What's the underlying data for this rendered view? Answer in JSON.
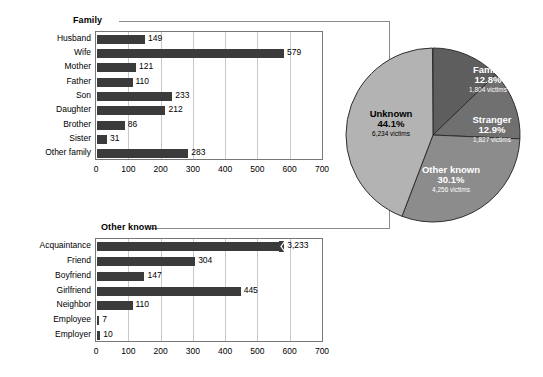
{
  "chart_data": [
    {
      "type": "bar",
      "orientation": "horizontal",
      "title": "Family",
      "categories": [
        "Husband",
        "Wife",
        "Mother",
        "Father",
        "Son",
        "Daughter",
        "Brother",
        "Sister",
        "Other family"
      ],
      "values": [
        149,
        579,
        121,
        110,
        233,
        212,
        86,
        31,
        283
      ],
      "value_labels": [
        "149",
        "579",
        "121",
        "110",
        "233",
        "212",
        "86",
        "31",
        "283"
      ],
      "xlabel": "",
      "ylabel": "",
      "xlim": [
        0,
        700
      ],
      "xticks": [
        0,
        100,
        200,
        300,
        400,
        500,
        600,
        700
      ],
      "xtick_labels": [
        "0",
        "100",
        "200",
        "300",
        "400",
        "500",
        "600",
        "700"
      ],
      "grid": true,
      "bar_color": "#3b3b3b",
      "legend": "none"
    },
    {
      "type": "bar",
      "orientation": "horizontal",
      "title": "Other known",
      "categories": [
        "Acquaintance",
        "Friend",
        "Boyfriend",
        "Girlfriend",
        "Neighbor",
        "Employee",
        "Employer"
      ],
      "values": [
        3233,
        304,
        147,
        445,
        110,
        7,
        10
      ],
      "value_labels": [
        "3,233",
        "304",
        "147",
        "445",
        "110",
        "7",
        "10"
      ],
      "truncated_bars": [
        "Acquaintance"
      ],
      "xlabel": "",
      "ylabel": "",
      "xlim": [
        0,
        700
      ],
      "xticks": [
        0,
        100,
        200,
        300,
        400,
        500,
        600,
        700
      ],
      "xtick_labels": [
        "0",
        "100",
        "200",
        "300",
        "400",
        "500",
        "600",
        "700"
      ],
      "grid": true,
      "bar_color": "#3b3b3b",
      "legend": "none"
    },
    {
      "type": "pie",
      "title": "",
      "slices": [
        {
          "name": "Family",
          "percent": 12.8,
          "percent_label": "12.8%",
          "count": 1804,
          "count_label": "1,804 victims",
          "color": "#5e5e5e"
        },
        {
          "name": "Stranger",
          "percent": 12.9,
          "percent_label": "12.9%",
          "count": 1827,
          "count_label": "1,827 victims",
          "color": "#707070"
        },
        {
          "name": "Other known",
          "percent": 30.1,
          "percent_label": "30.1%",
          "count": 4256,
          "count_label": "4,256 victims",
          "color": "#8c8c8c"
        },
        {
          "name": "Unknown",
          "percent": 44.1,
          "percent_label": "44.1%",
          "count": 6234,
          "count_label": "6,234 victims",
          "color": "#b3b3b3"
        }
      ],
      "start_angle_deg": 0,
      "direction": "clockwise",
      "legend": "labels-inside"
    }
  ],
  "panels": {
    "family": {
      "title": "Family",
      "categories": [
        {
          "label": "Husband",
          "value": 149,
          "value_label": "149"
        },
        {
          "label": "Wife",
          "value": 579,
          "value_label": "579"
        },
        {
          "label": "Mother",
          "value": 121,
          "value_label": "121"
        },
        {
          "label": "Father",
          "value": 110,
          "value_label": "110"
        },
        {
          "label": "Son",
          "value": 233,
          "value_label": "233"
        },
        {
          "label": "Daughter",
          "value": 212,
          "value_label": "212"
        },
        {
          "label": "Brother",
          "value": 86,
          "value_label": "86"
        },
        {
          "label": "Sister",
          "value": 31,
          "value_label": "31"
        },
        {
          "label": "Other family",
          "value": 283,
          "value_label": "283"
        }
      ],
      "xticks": [
        "0",
        "100",
        "200",
        "300",
        "400",
        "500",
        "600",
        "700"
      ]
    },
    "other_known": {
      "title": "Other known",
      "categories": [
        {
          "label": "Acquaintance",
          "value": 3233,
          "value_label": "3,233",
          "truncated": true
        },
        {
          "label": "Friend",
          "value": 304,
          "value_label": "304"
        },
        {
          "label": "Boyfriend",
          "value": 147,
          "value_label": "147"
        },
        {
          "label": "Girlfriend",
          "value": 445,
          "value_label": "445"
        },
        {
          "label": "Neighbor",
          "value": 110,
          "value_label": "110"
        },
        {
          "label": "Employee",
          "value": 7,
          "value_label": "7"
        },
        {
          "label": "Employer",
          "value": 10,
          "value_label": "10"
        }
      ],
      "xticks": [
        "0",
        "100",
        "200",
        "300",
        "400",
        "500",
        "600",
        "700"
      ]
    },
    "pie": {
      "slices": [
        {
          "name": "Family",
          "percent_label": "12.8%",
          "count_label": "1,804 victims"
        },
        {
          "name": "Stranger",
          "percent_label": "12.9%",
          "count_label": "1,827 victims"
        },
        {
          "name": "Other known",
          "percent_label": "30.1%",
          "count_label": "4,256 victims"
        },
        {
          "name": "Unknown",
          "percent_label": "44.1%",
          "count_label": "6,234 victims"
        }
      ]
    }
  },
  "colors": {
    "bar": "#3b3b3b",
    "grid": "#c9c9c9",
    "frame": "#777777",
    "leader": "#8a8a8a",
    "pie_family": "#5e5e5e",
    "pie_stranger": "#707070",
    "pie_other_known": "#8c8c8c",
    "pie_unknown": "#b3b3b3"
  }
}
